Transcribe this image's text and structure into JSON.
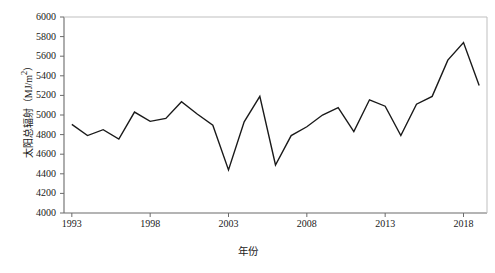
{
  "chart_data": {
    "type": "line",
    "title": "",
    "xlabel": "年份",
    "ylabel": "太阳总辐射（MJ/m²）",
    "ylabel_main": "太阳总辐射",
    "ylabel_unit": "（MJ/m",
    "ylabel_sup": "2",
    "ylabel_tail": "）",
    "xlim": [
      1992.5,
      2019.5
    ],
    "ylim": [
      4000,
      6000
    ],
    "y_ticks": [
      4000,
      4200,
      4400,
      4600,
      4800,
      5000,
      5200,
      5400,
      5600,
      5800,
      6000
    ],
    "x_ticks": [
      1993,
      1998,
      2003,
      2008,
      2013,
      2018
    ],
    "x_tick_labels": [
      "1993",
      "1998",
      "2003",
      "2008",
      "2013",
      "2018"
    ],
    "y_tick_labels": [
      "4000",
      "4200",
      "4400",
      "4600",
      "4800",
      "5000",
      "5200",
      "5400",
      "5600",
      "5800",
      "6000"
    ],
    "grid": false,
    "legend": null,
    "line_color": "#1a1a1a",
    "line_width": 1.4,
    "markers": false,
    "x": [
      1993,
      1994,
      1995,
      1996,
      1997,
      1998,
      1999,
      2000,
      2001,
      2002,
      2003,
      2004,
      2005,
      2006,
      2007,
      2008,
      2009,
      2010,
      2011,
      2012,
      2013,
      2014,
      2015,
      2016,
      2017,
      2018,
      2019
    ],
    "values": [
      4905,
      4790,
      4850,
      4755,
      5030,
      4935,
      4965,
      5135,
      5010,
      4895,
      4440,
      4930,
      5190,
      4490,
      4790,
      4880,
      5000,
      5075,
      4830,
      5155,
      5090,
      4790,
      5110,
      5190,
      5560,
      5740,
      5300
    ],
    "series": [
      {
        "name": "太阳总辐射",
        "values": [
          4905,
          4790,
          4850,
          4755,
          5030,
          4935,
          4965,
          5135,
          5010,
          4895,
          4440,
          4930,
          5190,
          4490,
          4790,
          4880,
          5000,
          5075,
          4830,
          5155,
          5090,
          4790,
          5110,
          5190,
          5560,
          5740,
          5300
        ]
      }
    ]
  },
  "axes": {
    "y_title": "太阳总辐射（MJ/m²）",
    "x_title": "年份"
  }
}
